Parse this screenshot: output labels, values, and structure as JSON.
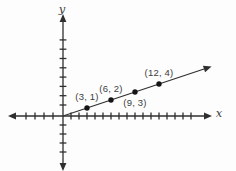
{
  "figure": {
    "background": "#fdfdfd",
    "ink_color": "#2f2f2f",
    "text_color": "#3c3c3c",
    "dot_color": "#151515"
  },
  "chart_data": {
    "type": "scatter",
    "title": "",
    "xlabel": "x",
    "ylabel": "y",
    "grid": false,
    "legend": false,
    "points": [
      {
        "x": 3,
        "y": 1,
        "label": "(3, 1)",
        "label_pos": "above"
      },
      {
        "x": 6,
        "y": 2,
        "label": "(6, 2)",
        "label_pos": "above"
      },
      {
        "x": 9,
        "y": 3,
        "label": "(9, 3)",
        "label_pos": "below"
      },
      {
        "x": 12,
        "y": 4,
        "label": "(12, 4)",
        "label_pos": "above"
      }
    ],
    "line": {
      "passes_through_origin": true,
      "slope": 0.3333,
      "arrow_at_end": true
    },
    "axes": {
      "x": {
        "ticks_positive": 16,
        "ticks_negative": 4,
        "arrows_both_ends": true
      },
      "y": {
        "ticks_positive": 8,
        "ticks_negative": 4,
        "arrows_both_ends": true
      }
    },
    "xlim": [
      -6,
      17.6
    ],
    "ylim": [
      -6.5,
      11.8
    ]
  }
}
